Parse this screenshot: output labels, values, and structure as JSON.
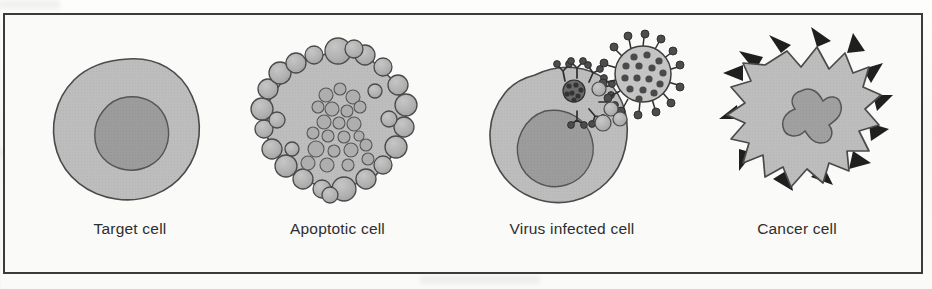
{
  "figure": {
    "type": "biology-diagram",
    "frame_color": "#3b3b3b",
    "background_color": "#fafaf9",
    "panels": [
      {
        "id": "target-cell",
        "label": "Target cell",
        "art": "smooth-round-cell-with-nucleus",
        "features": [
          "plasma membrane",
          "round nucleus"
        ],
        "cytoplasm_color": "#bdbdbd",
        "nucleus_color": "#9a9a9a",
        "outline_color": "#4a4a4a"
      },
      {
        "id": "apoptotic-cell",
        "label": "Apoptotic cell",
        "art": "blebbing-cell-with-fragmented-chromatin",
        "features": [
          "membrane blebs",
          "condensed chromatin fragments",
          "polygonal shrunken body"
        ],
        "cytoplasm_color": "#bdbdbd",
        "bleb_color": "#b2b2b2",
        "chromatin_color": "#a8a8a8",
        "outline_color": "#4a4a4a",
        "bleb_count": 26,
        "chromatin_body_count": 22
      },
      {
        "id": "virus-infected-cell",
        "label": "Virus infected cell",
        "art": "cell-with-budding-virion-and-surface-antigens",
        "features": [
          "nucleus",
          "viral surface antigen cluster",
          "spike glycoproteins",
          "budding virion"
        ],
        "cytoplasm_color": "#bdbdbd",
        "nucleus_color": "#9a9a9a",
        "virion_color": "#c4c4c4",
        "capsid_dot_color": "#4a4a4a",
        "spike_color": "#2f2f2f",
        "outline_color": "#4a4a4a"
      },
      {
        "id": "cancer-cell",
        "label": "Cancer cell",
        "art": "irregular-jagged-cell-with-tumor-antigens",
        "features": [
          "irregular jagged membrane",
          "tumour antigen spikes",
          "pleomorphic nucleus"
        ],
        "cytoplasm_color": "#bdbdbd",
        "nucleus_color": "#9e9e9e",
        "antigen_color": "#1f1f1f",
        "outline_color": "#4a4a4a",
        "antigen_count": 13
      }
    ]
  }
}
